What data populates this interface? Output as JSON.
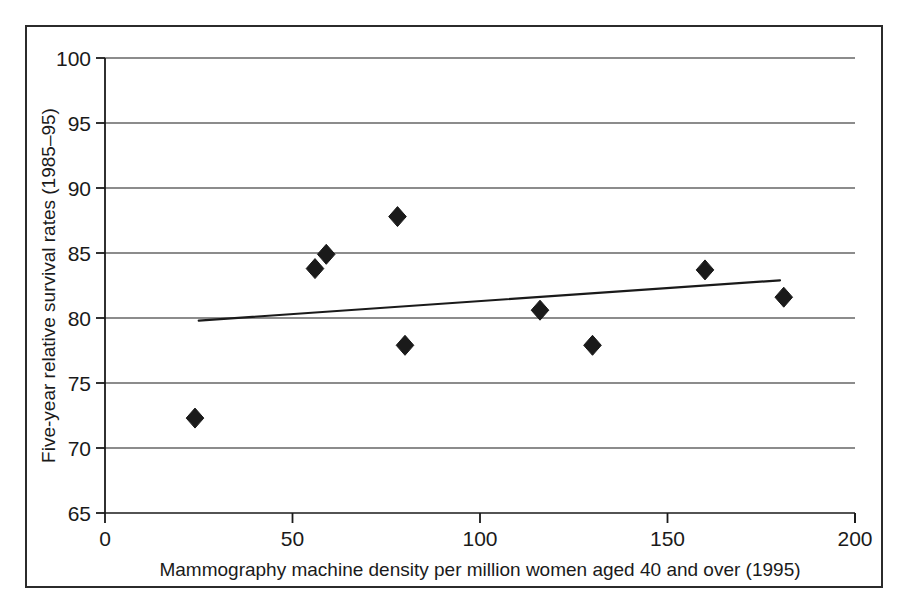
{
  "chart_data": {
    "type": "scatter",
    "title": "",
    "xlabel": "Mammography machine density per million women aged 40 and over (1995)",
    "ylabel": "Five-year relative survival rates (1985–95)",
    "xlim": [
      0,
      200
    ],
    "ylim": [
      65,
      100
    ],
    "xticks": [
      0,
      50,
      100,
      150,
      200
    ],
    "yticks": [
      65,
      70,
      75,
      80,
      85,
      90,
      95,
      100
    ],
    "xtick_labels": [
      "0",
      "50",
      "100",
      "150",
      "200"
    ],
    "ytick_labels": [
      "65",
      "70",
      "75",
      "80",
      "85",
      "90",
      "95",
      "100"
    ],
    "grid": "horizontal",
    "legend": "none",
    "marker": "filled-diamond",
    "marker_color": "#1a1a1a",
    "points": [
      {
        "x": 24,
        "y": 72.3
      },
      {
        "x": 56,
        "y": 83.8
      },
      {
        "x": 59,
        "y": 84.9
      },
      {
        "x": 78,
        "y": 87.8
      },
      {
        "x": 80,
        "y": 77.9
      },
      {
        "x": 116,
        "y": 80.6
      },
      {
        "x": 130,
        "y": 77.9
      },
      {
        "x": 160,
        "y": 83.7
      },
      {
        "x": 181,
        "y": 81.6
      }
    ],
    "trend_line": {
      "name": "fitted trend",
      "color": "#1a1a1a",
      "x": [
        25,
        180
      ],
      "y": [
        79.8,
        82.9
      ]
    }
  },
  "axes": {
    "y_axis_name": "y-axis",
    "x_axis_name": "x-axis"
  }
}
